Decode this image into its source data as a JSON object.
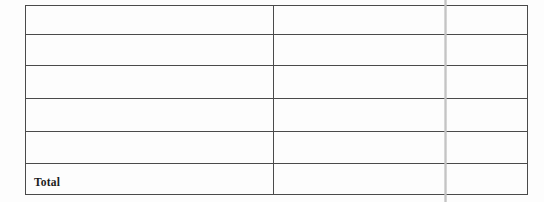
{
  "document": {
    "kind": "scanned-ruled-table",
    "background_color": "#fdfdfd",
    "border_color": "#4a4a4a",
    "text_color": "#1c1c1c"
  },
  "artifact": {
    "name": "vertical-scan-line",
    "color": "#c6c6c6",
    "description": ""
  },
  "table": {
    "columns": [
      {
        "key": "label",
        "header": ""
      },
      {
        "key": "value",
        "header": ""
      }
    ],
    "rows": [
      {
        "label": "",
        "value": ""
      },
      {
        "label": "",
        "value": ""
      },
      {
        "label": "",
        "value": ""
      },
      {
        "label": "",
        "value": ""
      },
      {
        "label": "",
        "value": ""
      },
      {
        "label": "Total",
        "value": ""
      }
    ]
  }
}
